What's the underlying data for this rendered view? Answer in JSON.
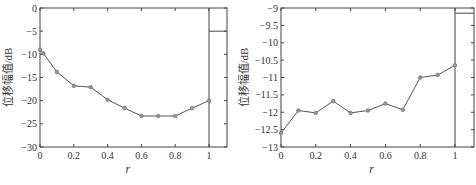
{
  "chart_data": [
    {
      "type": "line",
      "title": "",
      "xlabel": "r",
      "ylabel": "位移幅值/dB",
      "xlim": [
        0,
        1.1
      ],
      "ylim": [
        -30,
        0
      ],
      "xticks": [
        "0",
        "0.2",
        "0.4",
        "0.6",
        "0.8",
        "1"
      ],
      "yticks": [
        "0",
        "-5",
        "-10",
        "-15",
        "-20",
        "-25",
        "-30"
      ],
      "grid": false,
      "legend": null,
      "annotations": [
        "vertical line at r=1",
        "horizontal segment at -5 right of r=1"
      ],
      "series": [
        {
          "name": "位移幅值",
          "x": [
            0,
            0.02,
            0.1,
            0.2,
            0.3,
            0.4,
            0.5,
            0.6,
            0.7,
            0.8,
            0.9,
            1.0
          ],
          "values": [
            -9.0,
            -9.8,
            -13.8,
            -16.8,
            -17.1,
            -19.8,
            -21.6,
            -23.3,
            -23.3,
            -23.3,
            -21.6,
            -20.0
          ]
        }
      ]
    },
    {
      "type": "line",
      "title": "",
      "xlabel": "r",
      "ylabel": "位移幅值/dB",
      "xlim": [
        0,
        1.1
      ],
      "ylim": [
        -13,
        -9
      ],
      "xticks": [
        "0",
        "0.2",
        "0.4",
        "0.6",
        "0.8",
        "1"
      ],
      "yticks": [
        "-9",
        "-9.5",
        "-10",
        "-10.5",
        "-11",
        "-11.5",
        "-12",
        "-12.5",
        "-13"
      ],
      "grid": false,
      "legend": null,
      "annotations": [
        "vertical line at r=1",
        "horizontal segment at -9.15 right of r=1"
      ],
      "series": [
        {
          "name": "位移幅值",
          "x": [
            0,
            0.1,
            0.2,
            0.3,
            0.4,
            0.5,
            0.6,
            0.7,
            0.8,
            0.9,
            1.0
          ],
          "values": [
            -12.6,
            -11.95,
            -12.02,
            -11.68,
            -12.02,
            -11.95,
            -11.75,
            -11.93,
            -11.0,
            -10.93,
            -10.65
          ]
        }
      ]
    }
  ],
  "left": {
    "ylabel": "位移幅值/dB",
    "xlabel": "r"
  },
  "right": {
    "ylabel": "位移幅值/dB",
    "xlabel": "r"
  },
  "colors": {
    "line": "#555555",
    "axis": "#444444",
    "marker": "#777777"
  }
}
